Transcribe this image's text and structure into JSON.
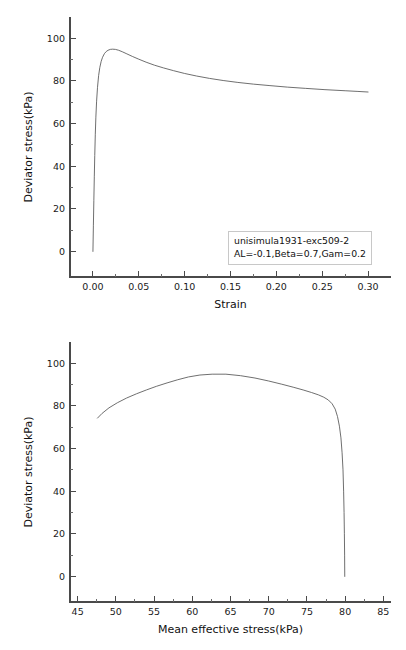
{
  "figures": [
    {
      "id": "deviator-stress-vs-strain",
      "annotation": {
        "line1": "unisimula1931-exc509-2",
        "line2": "AL=-0.1,Beta=0.7,Gam=0.2"
      },
      "chart_data": {
        "type": "line",
        "title": "",
        "xlabel": "Strain",
        "ylabel": "Deviator stress(kPa)",
        "xlim": [
          -0.025,
          0.325
        ],
        "ylim": [
          -12,
          110
        ],
        "xticks": [
          0.0,
          0.05,
          0.1,
          0.15,
          0.2,
          0.25,
          0.3
        ],
        "xticklabels": [
          "0.00",
          "0.05",
          "0.10",
          "0.15",
          "0.20",
          "0.25",
          "0.30"
        ],
        "xminor_step": 0.025,
        "yticks": [
          0,
          20,
          40,
          60,
          80,
          100
        ],
        "yticklabels": [
          "0",
          "20",
          "40",
          "60",
          "80",
          "100"
        ],
        "yminor_step": 10,
        "grid": false,
        "legend_position": "lower-right",
        "series": [
          {
            "name": "unisimula1931-exc509-2",
            "color": "#555555",
            "x": [
              0.0,
              0.0005,
              0.001,
              0.0015,
              0.002,
              0.0026,
              0.0032,
              0.004,
              0.005,
              0.0062,
              0.0075,
              0.009,
              0.0105,
              0.0125,
              0.0145,
              0.0165,
              0.019,
              0.0215,
              0.0245,
              0.028,
              0.032,
              0.037,
              0.043,
              0.05,
              0.058,
              0.067,
              0.077,
              0.088,
              0.1,
              0.113,
              0.127,
              0.142,
              0.158,
              0.175,
              0.193,
              0.212,
              0.232,
              0.253,
              0.275,
              0.288,
              0.3
            ],
            "y": [
              0.0,
              12.0,
              24.0,
              35.0,
              45.0,
              55.0,
              63.0,
              70.5,
              77.0,
              82.5,
              86.3,
              89.2,
              91.1,
              92.8,
              93.8,
              94.4,
              94.8,
              94.9,
              94.8,
              94.4,
              93.7,
              92.7,
              91.5,
              90.2,
              88.8,
              87.4,
              86.1,
              84.8,
              83.5,
              82.3,
              81.2,
              80.2,
              79.3,
              78.5,
              77.8,
              77.1,
              76.5,
              75.9,
              75.4,
              75.1,
              74.8
            ]
          }
        ]
      }
    },
    {
      "id": "deviator-stress-vs-mean-effective-stress",
      "annotation": {
        "line1": "unisimula1931-exc509-2",
        "line2": "AL=-0.1,Beta=0.7,Gam=0.2"
      },
      "chart_data": {
        "type": "line",
        "title": "",
        "xlabel": "Mean effective stress(kPa)",
        "ylabel": "Deviator stress(kPa)",
        "xlim": [
          44,
          86
        ],
        "ylim": [
          -12,
          110
        ],
        "xticks": [
          45,
          50,
          55,
          60,
          65,
          70,
          75,
          80,
          85
        ],
        "xticklabels": [
          "45",
          "50",
          "55",
          "60",
          "65",
          "70",
          "75",
          "80",
          "85"
        ],
        "xminor_step": 2.5,
        "yticks": [
          0,
          20,
          40,
          60,
          80,
          100
        ],
        "yticklabels": [
          "0",
          "20",
          "40",
          "60",
          "80",
          "100"
        ],
        "yminor_step": 10,
        "grid": false,
        "legend_position": "lower-left",
        "series": [
          {
            "name": "unisimula1931-exc509-2",
            "color": "#555555",
            "x": [
              79.95,
              79.93,
              79.9,
              79.86,
              79.8,
              79.72,
              79.6,
              79.45,
              79.25,
              79.0,
              78.7,
              78.3,
              77.8,
              77.2,
              76.5,
              75.6,
              74.5,
              73.2,
              71.7,
              70.0,
              68.2,
              66.3,
              64.4,
              62.6,
              61.0,
              59.5,
              58.1,
              56.7,
              55.3,
              54.0,
              52.7,
              51.4,
              50.2,
              49.1,
              48.2,
              47.6
            ],
            "y": [
              0.0,
              10.0,
              20.0,
              30.0,
              40.0,
              50.0,
              58.0,
              65.0,
              70.5,
              75.0,
              78.5,
              81.0,
              82.8,
              84.1,
              85.2,
              86.3,
              87.5,
              88.8,
              90.2,
              91.7,
              93.1,
              94.2,
              94.9,
              94.9,
              94.5,
              93.6,
              92.3,
              90.8,
              89.2,
              87.5,
              85.7,
              83.7,
              81.5,
              79.1,
              76.5,
              74.3
            ]
          }
        ]
      }
    }
  ]
}
